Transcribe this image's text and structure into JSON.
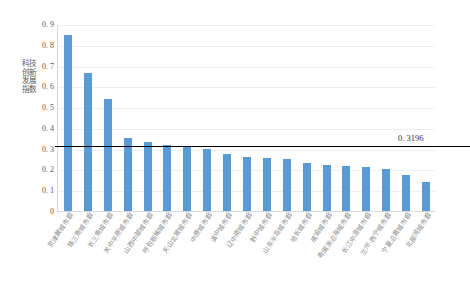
{
  "chart_data": {
    "type": "bar",
    "title": "",
    "xlabel": "",
    "ylabel": "科技创新发展指数",
    "ylim": [
      0,
      0.9
    ],
    "ytick_step": 0.1,
    "grid": true,
    "legend": "none",
    "bar_color": "#5b9bd5",
    "y_ticks": [
      "0.9",
      "0.8",
      "0.7",
      "0.6",
      "0.5",
      "0.4",
      "0.3",
      "0.2",
      "0.1",
      "0"
    ],
    "categories": [
      "京津冀城市群",
      "珠三角城市群",
      "长三角城市群",
      "关中平原城市群",
      "山西中部城市群",
      "呼包鄂榆城市群",
      "天山北坡城市群",
      "中原城市群",
      "滇中城市群",
      "辽中南城市群",
      "黔中城市群",
      "山东半岛城市群",
      "哈长城市群",
      "成渝城市群",
      "粤闽浙沿海城市群",
      "长江中游城市群",
      "兰州-西宁城市群",
      "宁夏沿黄城市群",
      "北部湾城市群"
    ],
    "values": [
      0.845,
      0.663,
      0.537,
      0.352,
      0.333,
      0.319,
      0.306,
      0.298,
      0.276,
      0.261,
      0.255,
      0.248,
      0.232,
      0.223,
      0.217,
      0.211,
      0.202,
      0.175,
      0.142
    ],
    "reference_line": {
      "value": 0.3196,
      "label": "0. 3196",
      "color": "#000000"
    }
  }
}
